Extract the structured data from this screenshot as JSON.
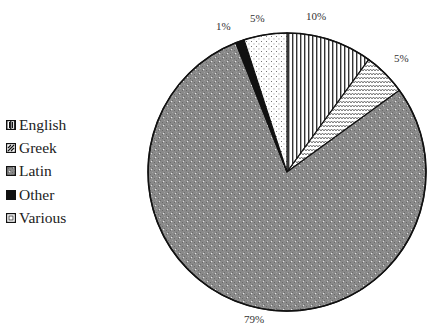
{
  "chart_data": {
    "type": "pie",
    "title": "",
    "categories": [
      "English",
      "Greek",
      "Latin",
      "Other",
      "Various"
    ],
    "values": [
      10,
      5,
      79,
      1,
      5
    ],
    "labels": [
      "10%",
      "5%",
      "79%",
      "1%",
      "5%"
    ],
    "legend_position": "left",
    "start_angle": "12 o'clock, clockwise",
    "patterns": {
      "English": "vertical-lines",
      "Greek": "zigzag",
      "Latin": "dense-dotted-gray",
      "Other": "solid-black",
      "Various": "sparse-dots"
    }
  },
  "legend": {
    "items": [
      {
        "label": "English"
      },
      {
        "label": "Greek"
      },
      {
        "label": "Latin"
      },
      {
        "label": "Other"
      },
      {
        "label": "Various"
      }
    ]
  },
  "slice_labels": {
    "english": "10%",
    "greek": "5%",
    "latin": "79%",
    "other": "1%",
    "various": "5%"
  }
}
